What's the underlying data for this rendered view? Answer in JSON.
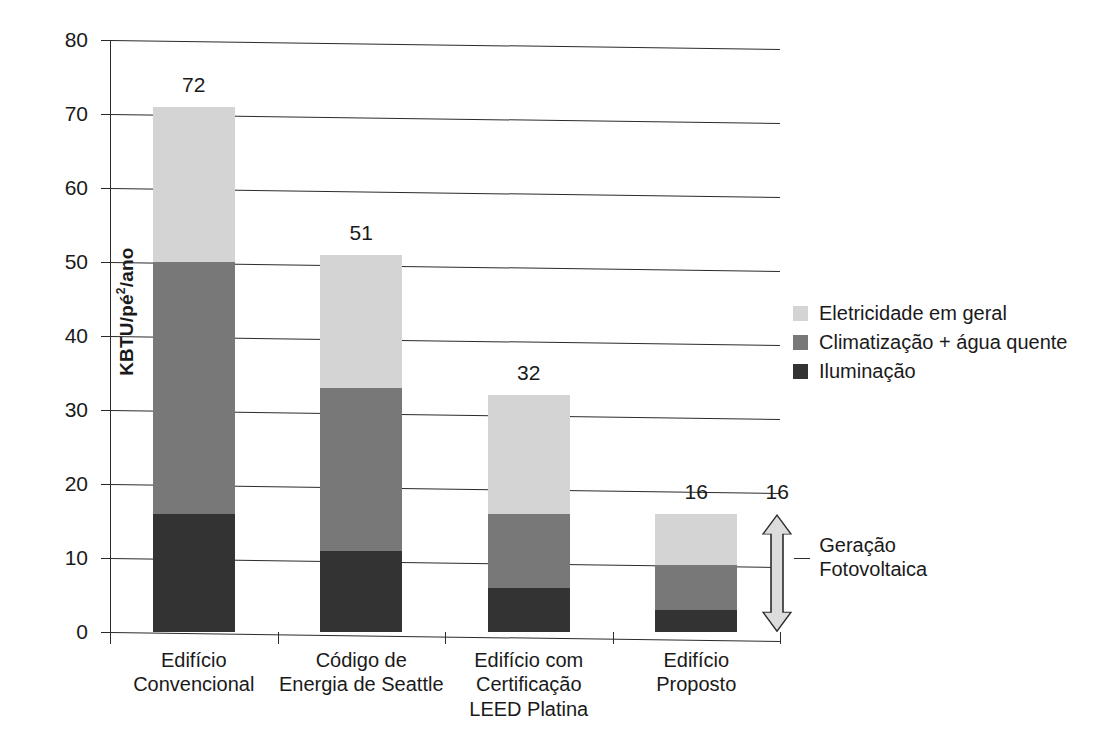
{
  "chart_data": {
    "type": "bar",
    "title": "",
    "subtitle": "",
    "xlabel": "",
    "ylabel": "KBTU/pé²/ano",
    "ylabel_main": "KBTU/pé",
    "ylabel_sup": "2",
    "ylabel_tail": "/ano",
    "ylim": [
      0,
      80
    ],
    "yticks": [
      0,
      10,
      20,
      30,
      40,
      50,
      60,
      70,
      80
    ],
    "ytick_labels": [
      "0",
      "10",
      "20",
      "30",
      "40",
      "50",
      "60",
      "70",
      "80"
    ],
    "grid": true,
    "grid_axis": "y",
    "stacked": true,
    "legend_position": "right",
    "categories": [
      "Edifício Convencional",
      "Código de Energia de Seattle",
      "Edifício com Certificação LEED Platina",
      "Edifício Proposto"
    ],
    "category_lines": [
      [
        "Edifício",
        "Convencional"
      ],
      [
        "Código de",
        "Energia de Seattle"
      ],
      [
        "Edifício com",
        "Certificação",
        "LEED Platina"
      ],
      [
        "Edifício",
        "Proposto"
      ]
    ],
    "series": [
      {
        "name": "Iluminação",
        "color": "#333333",
        "values": [
          16,
          11,
          6,
          3
        ]
      },
      {
        "name": "Climatização + água quente",
        "color": "#787878",
        "values": [
          34,
          22,
          10,
          6
        ]
      },
      {
        "name": "Eletricidade em geral",
        "color": "#d4d4d4",
        "values": [
          21,
          18,
          16,
          7
        ]
      }
    ],
    "totals": [
      72,
      51,
      32,
      16
    ],
    "total_labels": [
      "72",
      "51",
      "32",
      "16"
    ],
    "annotations": [
      {
        "name": "photovoltaic-generation",
        "value": 16,
        "value_label": "16",
        "text_lines": [
          "Geração",
          "Fotovoltaica"
        ],
        "range": [
          0,
          16
        ],
        "style": "double-headed-arrow"
      }
    ],
    "legend": [
      {
        "label": "Eletricidade em geral",
        "color": "#d4d4d4",
        "swatch": "light"
      },
      {
        "label": "Climatização + água quente",
        "color": "#787878",
        "swatch": "mid"
      },
      {
        "label": "Iluminação",
        "color": "#333333",
        "swatch": "dark"
      }
    ],
    "colors": {
      "light": "#d4d4d4",
      "mid": "#787878",
      "dark": "#333333",
      "axis": "#2b2b2b",
      "background": "#ffffff",
      "text": "#1a1a1a"
    }
  }
}
